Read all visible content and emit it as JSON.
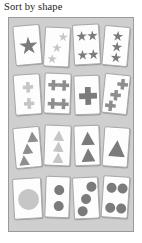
{
  "title": "Sort by shape",
  "panel": {
    "background_color": "#cfcfcf",
    "border_color": "#9a9a9a"
  },
  "colors": {
    "card_face": "#fdfdfd",
    "card_border": "#a8a8a8",
    "shape_dark": "#7b7b7b",
    "shape_medium": "#8e8e8e",
    "shape_light": "#c6c6c6",
    "title_text": "#1c1c1c"
  },
  "rows": [
    {
      "shape": "star",
      "shape_label": "Star",
      "cards": [
        {
          "count": 1,
          "tone": "shape_dark",
          "size": 19,
          "rotate": -5,
          "layout": "single",
          "left": 5,
          "top": 4,
          "w": 27,
          "h": 40
        },
        {
          "count": 3,
          "tone": "shape_light",
          "size": 10,
          "rotate": 3,
          "layout": "diagonal",
          "left": 35,
          "top": 6,
          "w": 26,
          "h": 40
        },
        {
          "count": 4,
          "tone": "shape_dark",
          "size": 11,
          "rotate": -3,
          "layout": "quad",
          "left": 64,
          "top": 3,
          "w": 27,
          "h": 41
        },
        {
          "count": 3,
          "tone": "shape_dark",
          "size": 11,
          "rotate": 5,
          "layout": "column",
          "left": 94,
          "top": 5,
          "w": 26,
          "h": 40
        }
      ]
    },
    {
      "shape": "cross",
      "shape_label": "Cross",
      "cards": [
        {
          "count": 2,
          "tone": "shape_light",
          "size": 11,
          "rotate": -4,
          "layout": "column",
          "left": 5,
          "top": 4,
          "w": 27,
          "h": 41
        },
        {
          "count": 4,
          "tone": "shape_medium",
          "size": 11,
          "rotate": 2,
          "layout": "quad",
          "left": 35,
          "top": 3,
          "w": 27,
          "h": 41
        },
        {
          "count": 1,
          "tone": "shape_dark",
          "size": 18,
          "rotate": -2,
          "layout": "single",
          "left": 65,
          "top": 5,
          "w": 26,
          "h": 40
        },
        {
          "count": 3,
          "tone": "shape_medium",
          "size": 11,
          "rotate": 6,
          "layout": "diagonal",
          "left": 94,
          "top": 4,
          "w": 26,
          "h": 40
        }
      ]
    },
    {
      "shape": "triangle",
      "shape_label": "Triangle",
      "cards": [
        {
          "count": 3,
          "tone": "shape_medium",
          "size": 11,
          "rotate": -5,
          "layout": "diagonal",
          "left": 5,
          "top": 5,
          "w": 27,
          "h": 41
        },
        {
          "count": 3,
          "tone": "shape_light",
          "size": 11,
          "rotate": 2,
          "layout": "column",
          "left": 35,
          "top": 3,
          "w": 27,
          "h": 41
        },
        {
          "count": 2,
          "tone": "shape_dark",
          "size": 14,
          "rotate": -2,
          "layout": "column",
          "left": 65,
          "top": 3,
          "w": 26,
          "h": 41
        },
        {
          "count": 1,
          "tone": "shape_dark",
          "size": 17,
          "rotate": 4,
          "layout": "single",
          "left": 94,
          "top": 5,
          "w": 26,
          "h": 40
        }
      ]
    },
    {
      "shape": "circle",
      "shape_label": "Circle",
      "cards": [
        {
          "count": 1,
          "tone": "shape_light",
          "size": 21,
          "rotate": -3,
          "layout": "single",
          "left": 4,
          "top": 5,
          "w": 29,
          "h": 41
        },
        {
          "count": 2,
          "tone": "shape_dark",
          "size": 10,
          "rotate": 2,
          "layout": "column",
          "left": 36,
          "top": 3,
          "w": 25,
          "h": 42
        },
        {
          "count": 3,
          "tone": "shape_dark",
          "size": 10,
          "rotate": -3,
          "layout": "diagonal",
          "left": 64,
          "top": 4,
          "w": 26,
          "h": 42
        },
        {
          "count": 4,
          "tone": "shape_dark",
          "size": 10,
          "rotate": 4,
          "layout": "quad",
          "left": 93,
          "top": 3,
          "w": 27,
          "h": 42
        }
      ]
    }
  ]
}
